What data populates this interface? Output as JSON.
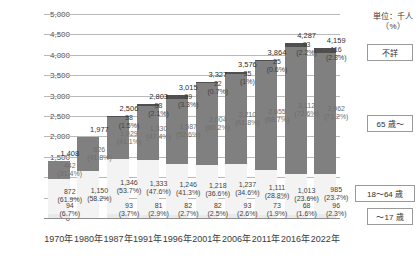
{
  "chart_data": {
    "type": "bar",
    "stacked": true,
    "title": "",
    "xlabel": "",
    "ylabel": "",
    "ylim": [
      0,
      5000
    ],
    "yticks": [
      "0",
      "500",
      "1,000",
      "1,500",
      "2,000",
      "2,500",
      "3,000",
      "3,500",
      "4,000",
      "4,500",
      "5,000"
    ],
    "ytick_values": [
      0,
      500,
      1000,
      1500,
      2000,
      2500,
      3000,
      3500,
      4000,
      4500,
      5000
    ],
    "grid": true,
    "unit_note_line1": "単位：千人",
    "unit_note_line2": "（%）",
    "categories": [
      "1970年",
      "1980年",
      "1987年",
      "1991年",
      "1996年",
      "2001年",
      "2006年",
      "2011年",
      "2016年",
      "2022年"
    ],
    "legend_position": "right",
    "legend": [
      {
        "key": "unknown",
        "label": "不詳",
        "color": "#4f4f4f"
      },
      {
        "key": "age65",
        "label": "65 歳～",
        "color": "#808080"
      },
      {
        "key": "age1864",
        "label": "18～64 歳",
        "color": "#f3f3f3"
      },
      {
        "key": "age17",
        "label": "～17 歳",
        "color": "#e9e9e9"
      }
    ],
    "totals": [
      "1,408",
      "1,977",
      "2,506",
      "2,803",
      "3,015",
      "3,327",
      "3,576",
      "3,864",
      "4,287",
      "4,159"
    ],
    "total_values": [
      1408,
      1977,
      2506,
      2803,
      3015,
      3327,
      3576,
      3864,
      4287,
      4159
    ],
    "series": [
      {
        "name": "～17 歳",
        "key": "age17",
        "values": [
          94,
          0,
          93,
          81,
          82,
          82,
          93,
          73,
          68,
          96
        ],
        "labels": [
          "94",
          "",
          "93",
          "81",
          "82",
          "82",
          "93",
          "73",
          "68",
          "96"
        ],
        "pct_labels": [
          "(6.7%)",
          "",
          "(3.7%)",
          "(2.9%)",
          "(2.7%)",
          "(2.5%)",
          "(2.6%)",
          "(1.9%)",
          "(1.6%)",
          "(2.3%)"
        ]
      },
      {
        "name": "18～64 歳",
        "key": "age1864",
        "values": [
          872,
          1150,
          1346,
          1333,
          1246,
          1218,
          1237,
          1111,
          1013,
          985
        ],
        "labels": [
          "872",
          "1,150",
          "1,346",
          "1,333",
          "1,246",
          "1,218",
          "1,237",
          "1,111",
          "1,013",
          "985"
        ],
        "pct_labels": [
          "(61.9%)",
          "(58.2%)",
          "(53.7%)",
          "(47.6%)",
          "(41.3%)",
          "(36.6%)",
          "(34.6%)",
          "(28.8%)",
          "(23.6%)",
          "(23.7%)"
        ]
      },
      {
        "name": "65 歳～",
        "key": "age65",
        "values": [
          442,
          826,
          1029,
          1330,
          1587,
          2004,
          2210,
          2655,
          3112,
          2962
        ],
        "labels": [
          "442",
          "826",
          "1,029",
          "1,330",
          "1,587",
          "2,004",
          "2,210",
          "2,655",
          "3,112",
          "2,962"
        ],
        "pct_labels": [
          "(31.4%)",
          "(41.8%)",
          "(41.1%)",
          "(47.4%)",
          "(52.6%)",
          "(60.2%)",
          "(61.8%)",
          "(68.7%)",
          "(72.6%)",
          "(71.2%)"
        ]
      },
      {
        "name": "不詳",
        "key": "unknown",
        "values": [
          0,
          0,
          38,
          58,
          99,
          22,
          35,
          25,
          93,
          116
        ],
        "labels": [
          "",
          "",
          "38",
          "58",
          "99",
          "22",
          "35",
          "25",
          "93",
          "116"
        ],
        "pct_labels": [
          "",
          "",
          "(1.5%)",
          "(2.1%)",
          "(3.3%)",
          "(0.7%)",
          "(1%)",
          "(0.6%)",
          "(2.2%)",
          "(2.8%)"
        ]
      }
    ]
  }
}
